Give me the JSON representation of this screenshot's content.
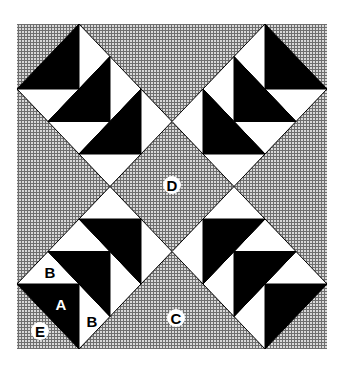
{
  "diagram": {
    "type": "quilt-block-pattern",
    "colors": {
      "background": "#ffffff",
      "field_texture": "#8a8a8a",
      "field_light": "#d6d6d6",
      "dark_patch": "#000000",
      "light_patch": "#ffffff",
      "outline": "#000000"
    },
    "frame": {
      "x": 17,
      "y": 24,
      "width": 310,
      "height": 325,
      "units": 10
    },
    "labels": [
      {
        "id": "D",
        "text": "D",
        "x": 172,
        "y": 185,
        "style": "circle"
      },
      {
        "id": "C",
        "text": "C",
        "x": 176,
        "y": 318,
        "style": "circle"
      },
      {
        "id": "E",
        "text": "E",
        "x": 40,
        "y": 331,
        "style": "circle"
      },
      {
        "id": "A",
        "text": "A",
        "x": 61,
        "y": 304,
        "style": "on-dark"
      },
      {
        "id": "B1",
        "text": "B",
        "x": 50,
        "y": 272,
        "style": "on-light"
      },
      {
        "id": "B2",
        "text": "B",
        "x": 92,
        "y": 321,
        "style": "on-light"
      }
    ],
    "patch_legend": {
      "A": "large dark triangle",
      "B": "small light triangle",
      "C": "large background triangle (side)",
      "D": "center background square",
      "E": "corner background triangle"
    }
  }
}
